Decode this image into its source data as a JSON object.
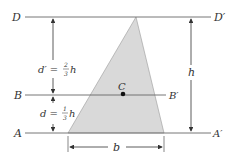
{
  "diagram": {
    "labels": {
      "D": "D",
      "D_prime": "D′",
      "B": "B",
      "B_prime": "B′",
      "A": "A",
      "A_prime": "A′",
      "C": "C",
      "h": "h",
      "b": "b",
      "d_prime": "d′ =",
      "d": "d =",
      "frac_two_thirds_num": "2",
      "frac_two_thirds_den": "3",
      "frac_one_third_num": "1",
      "frac_one_third_den": "3",
      "h_suffix": "h"
    },
    "colors": {
      "triangle_fill": "#d9d9d9",
      "line": "#555555",
      "text": "#333333"
    }
  }
}
